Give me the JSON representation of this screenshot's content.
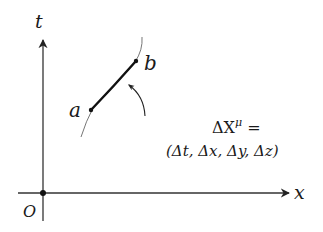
{
  "diagram": {
    "type": "spacetime-diagram",
    "colors": {
      "axis": "#333333",
      "worldline_thin": "#555555",
      "segment": "#111111",
      "text": "#1a1a1a"
    },
    "axes": {
      "vertical_label": "t",
      "horizontal_label": "x",
      "origin_label": "O"
    },
    "points": {
      "a_label": "a",
      "b_label": "b"
    },
    "annotation": {
      "line1": "ΔX",
      "line1_sup": "μ",
      "line1_eq": " =",
      "line2": "(Δt, Δx, Δy, Δz)"
    }
  }
}
